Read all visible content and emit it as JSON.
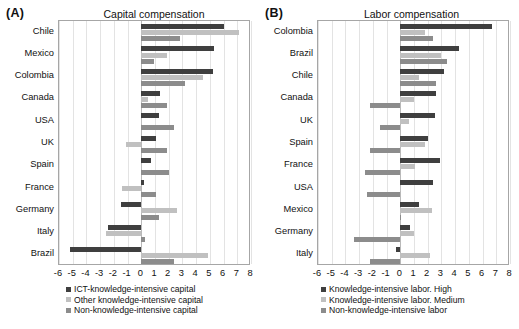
{
  "figure": {
    "panels": [
      {
        "letter": "(A)",
        "title": "Capital compensation",
        "categories": [
          "Chile",
          "Mexico",
          "Colombia",
          "Canada",
          "USA",
          "UK",
          "Spain",
          "France",
          "Germany",
          "Italy",
          "Brazil"
        ],
        "xticks": [
          "-6",
          "-5",
          "-4",
          "-3",
          "-2",
          "-1",
          "0",
          "1",
          "2",
          "3",
          "4",
          "5",
          "6",
          "7",
          "8"
        ],
        "legend": [
          {
            "label": "ICT-knowledge-intensive capital",
            "color": "#3f3f3f"
          },
          {
            "label": "Other knowledge-intensive capital",
            "color": "#c0c0c0"
          },
          {
            "label": "Non-knowledge-intensive capital",
            "color": "#8c8c8c"
          }
        ]
      },
      {
        "letter": "(B)",
        "title": "Labor compensation",
        "categories": [
          "Colombia",
          "Brazil",
          "Chile",
          "Canada",
          "UK",
          "Spain",
          "France",
          "USA",
          "Mexico",
          "Germany",
          "Italy"
        ],
        "xticks": [
          "-6",
          "-5",
          "-4",
          "-3",
          "-2",
          "-1",
          "0",
          "1",
          "2",
          "3",
          "4",
          "5",
          "6",
          "7",
          "8"
        ],
        "legend": [
          {
            "label": "Knowledge-intensive labor. High",
            "color": "#3f3f3f"
          },
          {
            "label": "Knowledge-intensive labor. Medium",
            "color": "#c0c0c0"
          },
          {
            "label": "Non-knowledge-intensive labor",
            "color": "#8c8c8c"
          }
        ]
      }
    ]
  },
  "chart_data": [
    {
      "type": "bar",
      "title": "Capital compensation",
      "panel": "(A)",
      "orientation": "horizontal",
      "xlabel": "",
      "ylabel": "",
      "xlim": [
        -6,
        8
      ],
      "xticks": [
        -6,
        -5,
        -4,
        -3,
        -2,
        -1,
        0,
        1,
        2,
        3,
        4,
        5,
        6,
        7,
        8
      ],
      "grid": true,
      "legend_position": "below",
      "categories": [
        "Chile",
        "Mexico",
        "Colombia",
        "Canada",
        "USA",
        "UK",
        "Spain",
        "France",
        "Germany",
        "Italy",
        "Brazil"
      ],
      "series": [
        {
          "name": "ICT-knowledge-intensive capital",
          "color": "#3f3f3f",
          "values": [
            6.0,
            5.3,
            5.2,
            1.4,
            1.3,
            1.1,
            0.7,
            0.2,
            -1.5,
            -2.4,
            -5.2
          ]
        },
        {
          "name": "Other knowledge-intensive capital",
          "color": "#c0c0c0",
          "values": [
            7.1,
            1.9,
            4.5,
            0.5,
            0.0,
            -1.1,
            0.0,
            -1.4,
            2.6,
            -2.6,
            4.9
          ]
        },
        {
          "name": "Non-knowledge-intensive capital",
          "color": "#8c8c8c",
          "values": [
            2.8,
            0.9,
            3.2,
            1.9,
            2.4,
            1.9,
            2.0,
            1.1,
            1.3,
            0.3,
            2.4
          ]
        }
      ]
    },
    {
      "type": "bar",
      "title": "Labor compensation",
      "panel": "(B)",
      "orientation": "horizontal",
      "xlabel": "",
      "ylabel": "",
      "xlim": [
        -6,
        8
      ],
      "xticks": [
        -6,
        -5,
        -4,
        -3,
        -2,
        -1,
        0,
        1,
        2,
        3,
        4,
        5,
        6,
        7,
        8
      ],
      "grid": true,
      "legend_position": "below",
      "categories": [
        "Colombia",
        "Brazil",
        "Chile",
        "Canada",
        "UK",
        "Spain",
        "France",
        "USA",
        "Mexico",
        "Germany",
        "Italy"
      ],
      "series": [
        {
          "name": "Knowledge-intensive labor. High",
          "color": "#3f3f3f",
          "values": [
            6.7,
            4.3,
            3.2,
            2.6,
            2.5,
            2.0,
            2.9,
            2.4,
            1.4,
            0.7,
            -0.3
          ]
        },
        {
          "name": "Knowledge-intensive labor. Medium",
          "color": "#c0c0c0",
          "values": [
            1.8,
            3.0,
            1.4,
            1.0,
            0.6,
            1.8,
            1.1,
            0.0,
            2.3,
            1.0,
            2.2
          ]
        },
        {
          "name": "Non-knowledge-intensive labor",
          "color": "#8c8c8c",
          "values": [
            2.4,
            3.4,
            2.6,
            -2.2,
            -1.5,
            -2.2,
            -2.6,
            -2.4,
            0.05,
            -3.4,
            -2.2
          ]
        }
      ]
    }
  ]
}
